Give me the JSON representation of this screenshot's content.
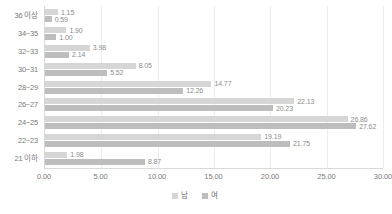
{
  "chart_data": {
    "type": "bar",
    "orientation": "horizontal",
    "title": "",
    "xlabel": "",
    "ylabel": "",
    "xlim": [
      0,
      30
    ],
    "xticks": [
      "0.00",
      "5.00",
      "10.00",
      "15.00",
      "20.00",
      "25.00",
      "30.00"
    ],
    "xtick_values": [
      0,
      5,
      10,
      15,
      20,
      25,
      30
    ],
    "grid": true,
    "legend_position": "bottom",
    "categories": [
      "36 이상",
      "34~35",
      "32~33",
      "30~31",
      "28~29",
      "26~27",
      "24~25",
      "22~23",
      "21 이하"
    ],
    "series": [
      {
        "name": "남",
        "color": "#d6d6d6",
        "values": [
          1.15,
          1.9,
          3.98,
          8.05,
          14.77,
          22.13,
          26.86,
          19.19,
          1.98
        ],
        "labels": [
          "1.15",
          "1.90",
          "3.98",
          "8.05",
          "14.77",
          "22.13",
          "26.86",
          "19.19",
          "1.98"
        ]
      },
      {
        "name": "여",
        "color": "#bdbdbd",
        "values": [
          0.59,
          1.0,
          2.14,
          5.52,
          12.26,
          20.23,
          27.62,
          21.75,
          8.87
        ],
        "labels": [
          "0.59",
          "1.00",
          "2.14",
          "5.52",
          "12.26",
          "20.23",
          "27.62",
          "21.75",
          "8.87"
        ]
      }
    ]
  },
  "legend": {
    "items": [
      {
        "label": "남",
        "color": "#d6d6d6"
      },
      {
        "label": "여",
        "color": "#bdbdbd"
      }
    ]
  },
  "axis": {
    "x_tick_labels": [
      "0.00",
      "5.00",
      "10.00",
      "15.00",
      "20.00",
      "25.00",
      "30.00"
    ],
    "y_tick_labels": [
      "36 이상",
      "34~35",
      "32~33",
      "30~31",
      "28~29",
      "26~27",
      "24~25",
      "22~23",
      "21 이하"
    ]
  },
  "colors": {
    "male": "#d6d6d6",
    "female": "#bdbdbd",
    "grid": "#ededed",
    "axis": "#d9d9d9",
    "text": "#7a7a7a"
  }
}
